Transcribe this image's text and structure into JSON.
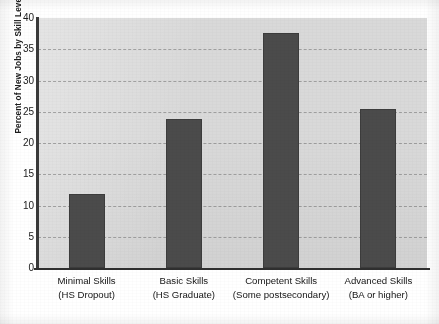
{
  "chart_data": {
    "type": "bar",
    "title": "",
    "title_fragment_visible": "",
    "categories": [
      "Minimal Skills",
      "Basic Skills",
      "Competent Skills",
      "Advanced Skills"
    ],
    "category_sublabels": [
      "(HS Dropout)",
      "(HS Graduate)",
      "(Some postsecondary)",
      "(BA or higher)"
    ],
    "values": [
      11.8,
      23.8,
      37.6,
      25.4
    ],
    "xlabel": "",
    "ylabel": "Percent of New Jobs by Skill Level",
    "ylim": [
      0,
      40
    ],
    "ytick_values": [
      0,
      5,
      10,
      15,
      20,
      25,
      30,
      35,
      40
    ],
    "ytick_labels": [
      "0",
      "5",
      "10",
      "15",
      "20",
      "25",
      "30",
      "35",
      "40"
    ],
    "grid": "horizontal-dashed",
    "legend": "none",
    "bar_color": "#4b4b4b",
    "plot_background_color": "#d9d9d9",
    "axis_color": "#2f2f2f",
    "gridline_color": "#6e6e6e"
  }
}
